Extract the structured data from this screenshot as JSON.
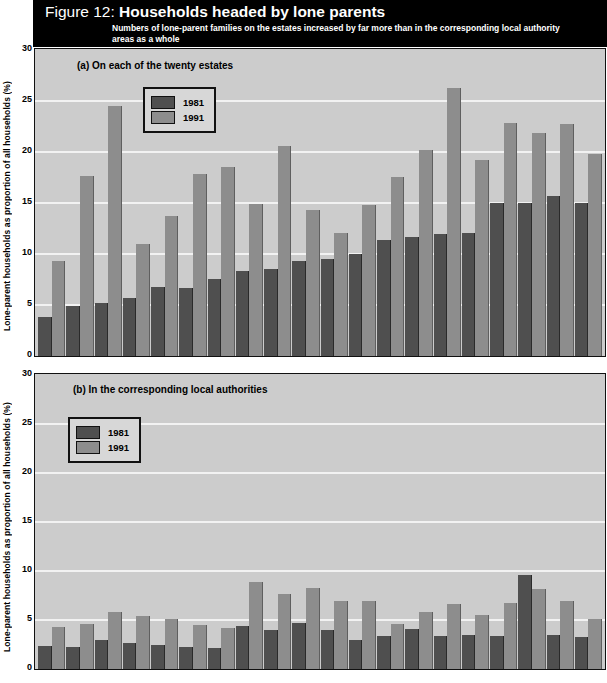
{
  "header": {
    "figure_label": "Figure 12:",
    "title": "Households headed by lone parents",
    "subtitle": "Numbers of lone-parent families on the estates increased by far more than in the corresponding local authority areas as a whole"
  },
  "axis": {
    "ylabel": "Lone-parent households as proportion of all households (%)",
    "ticks": [
      "30",
      "25",
      "20",
      "15",
      "10",
      "5",
      "0"
    ]
  },
  "legend": {
    "items": [
      {
        "label": "1981",
        "color": "#4f4f4f"
      },
      {
        "label": "1991",
        "color": "#8d8d8d"
      }
    ]
  },
  "panel_a": {
    "title": "(a) On each of the twenty estates"
  },
  "panel_b": {
    "title": "(b) In the corresponding local authorities"
  },
  "chart_data": [
    {
      "type": "bar",
      "id": "panel-a",
      "title": "(a) On each of the twenty estates",
      "xlabel": "",
      "ylabel": "Lone-parent households as proportion of all households (%)",
      "ylim": [
        0,
        30
      ],
      "ytick_values": [
        0,
        5,
        10,
        15,
        20,
        25,
        30
      ],
      "grid": true,
      "legend_position": "top-left-inside",
      "categories": [
        "1",
        "2",
        "3",
        "4",
        "5",
        "6",
        "7",
        "8",
        "9",
        "10",
        "11",
        "12",
        "13",
        "14",
        "15",
        "16",
        "17",
        "18",
        "19",
        "20"
      ],
      "series": [
        {
          "name": "1981",
          "color": "#4f4f4f",
          "values": [
            3.8,
            4.9,
            5.2,
            5.7,
            6.7,
            6.6,
            7.5,
            8.3,
            8.5,
            9.3,
            9.5,
            10.0,
            11.3,
            11.6,
            11.9,
            12.0,
            15.0,
            15.0,
            15.6,
            15.0
          ]
        },
        {
          "name": "1991",
          "color": "#8d8d8d",
          "values": [
            9.3,
            17.6,
            24.4,
            10.9,
            13.7,
            17.8,
            18.5,
            14.9,
            20.5,
            14.3,
            12.0,
            14.8,
            17.5,
            20.1,
            26.2,
            19.2,
            22.8,
            21.8,
            22.7,
            19.7
          ]
        }
      ]
    },
    {
      "type": "bar",
      "id": "panel-b",
      "title": "(b) In the corresponding local authorities",
      "xlabel": "",
      "ylabel": "Lone-parent households as proportion of all households (%)",
      "ylim": [
        0,
        30
      ],
      "ytick_values": [
        0,
        5,
        10,
        15,
        20,
        25,
        30
      ],
      "grid": true,
      "legend_position": "top-left-inside",
      "categories": [
        "1",
        "2",
        "3",
        "4",
        "5",
        "6",
        "7",
        "8",
        "9",
        "10",
        "11",
        "12",
        "13",
        "14",
        "15",
        "16",
        "17",
        "18",
        "19",
        "20"
      ],
      "series": [
        {
          "name": "1981",
          "color": "#4f4f4f",
          "values": [
            2.3,
            2.2,
            2.9,
            2.6,
            2.4,
            2.2,
            2.1,
            4.4,
            4.0,
            4.7,
            4.0,
            3.0,
            3.4,
            4.1,
            3.4,
            3.5,
            3.4,
            9.6,
            3.5,
            3.3
          ]
        },
        {
          "name": "1991",
          "color": "#8d8d8d",
          "values": [
            4.3,
            4.6,
            5.8,
            5.4,
            5.1,
            4.5,
            4.2,
            8.8,
            7.6,
            8.2,
            6.9,
            6.9,
            4.6,
            5.8,
            6.6,
            5.5,
            6.7,
            8.1,
            6.9,
            5.1
          ]
        }
      ]
    }
  ]
}
